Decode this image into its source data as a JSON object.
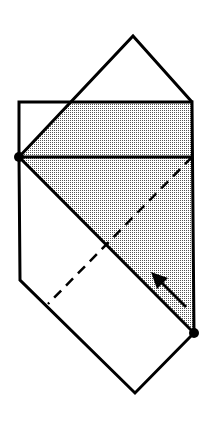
{
  "diagram": {
    "colors": {
      "stroke": "#000000",
      "fill": "#bdbdbd",
      "background": "#ffffff"
    },
    "shapes": {
      "top_triangle": "19,157 133,36 192,102",
      "shaded_region": "71,102 192,102 194,333 19,157",
      "outline": "19,102 192,102 194,333 135,393 20,280",
      "horizontal_crease": [
        19,
        157,
        192,
        157
      ],
      "lower_diagonal": [
        19,
        157,
        194,
        333
      ],
      "dashed_line": [
        192,
        157,
        48,
        304
      ],
      "arrow": [
        186,
        307,
        153,
        274
      ]
    },
    "points": [
      {
        "name": "left-point",
        "x": 19,
        "y": 157
      },
      {
        "name": "right-point",
        "x": 194,
        "y": 333
      }
    ]
  }
}
